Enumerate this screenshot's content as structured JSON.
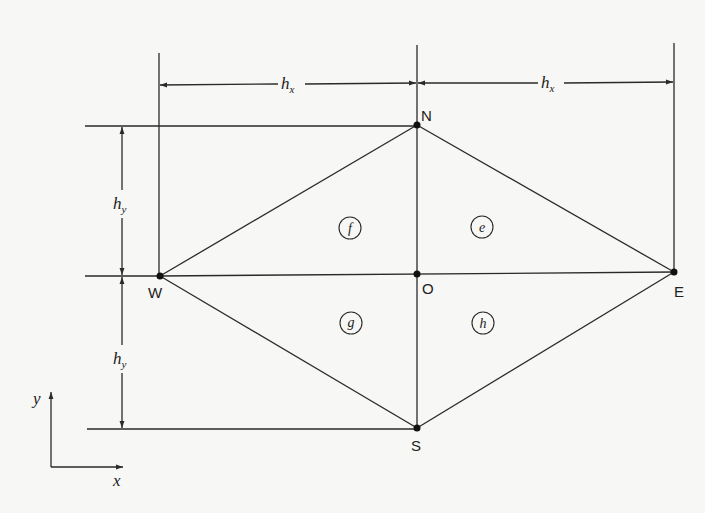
{
  "diagram": {
    "type": "finite-element mesh stencil",
    "nodes": [
      {
        "id": "N",
        "label": "N",
        "x": 417,
        "y": 125
      },
      {
        "id": "W",
        "label": "W",
        "x": 160,
        "y": 276
      },
      {
        "id": "O",
        "label": "O",
        "x": 417,
        "y": 274
      },
      {
        "id": "E",
        "label": "E",
        "x": 674,
        "y": 272
      },
      {
        "id": "S",
        "label": "S",
        "x": 417,
        "y": 428
      }
    ],
    "regions": [
      {
        "id": "f",
        "label": "f"
      },
      {
        "id": "e",
        "label": "e"
      },
      {
        "id": "g",
        "label": "g"
      },
      {
        "id": "h",
        "label": "h"
      }
    ],
    "dimensions": {
      "hx_left": {
        "base": "h",
        "sub": "x"
      },
      "hx_right": {
        "base": "h",
        "sub": "x"
      },
      "hy_top": {
        "base": "h",
        "sub": "y"
      },
      "hy_bottom": {
        "base": "h",
        "sub": "y"
      }
    },
    "axes": {
      "x_label": "x",
      "y_label": "y"
    }
  }
}
